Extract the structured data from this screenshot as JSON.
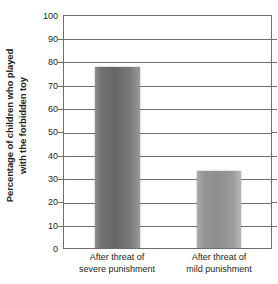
{
  "chart_data": {
    "type": "bar",
    "title": "",
    "subtitle": "",
    "xlabel": "",
    "ylabel": "Percentage of children who played with the forbidden toy",
    "ylabel_lines": [
      "Percentage of children who played",
      "with the forbidden toy"
    ],
    "categories": [
      "After threat of severe punishment",
      "After threat of mild punishment"
    ],
    "category_lines": [
      [
        "After threat of",
        "severe punishment"
      ],
      [
        "After threat of",
        "mild punishment"
      ]
    ],
    "values": [
      78,
      33
    ],
    "ylim": [
      0,
      100
    ],
    "ytick_step": 10,
    "yticks": [
      100,
      90,
      80,
      70,
      60,
      50,
      40,
      30,
      20,
      10,
      0
    ],
    "ytick_labels": [
      "100",
      "90",
      "80",
      "70",
      "60",
      "50",
      "40",
      "30",
      "20",
      "10",
      "0"
    ],
    "grid": true,
    "grid_axis": "y",
    "legend": false,
    "legend_position": "none",
    "series": [
      {
        "name": "Percentage of children who played with the forbidden toy",
        "values": [
          78,
          33
        ]
      }
    ],
    "colors": {
      "bar_severe": "#6f7072",
      "bar_mild": "#939496",
      "gridline": "#6d6e71",
      "frame": "#6d6e71",
      "text": "#231f20",
      "background": "#ffffff"
    }
  }
}
